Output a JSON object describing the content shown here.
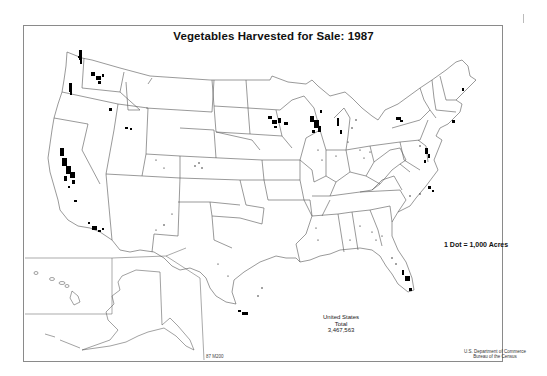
{
  "map": {
    "title": "Vegetables Harvested for Sale: 1987",
    "legend": "1 Dot = 1,000 Acres",
    "total": {
      "line1": "United States",
      "line2": "Total",
      "value": "3,467,563"
    },
    "credit": {
      "line1": "U.S. Department of Commerce",
      "line2": "Bureau of the Census"
    },
    "map_code": "87 M200",
    "type": "dot-density",
    "region": "United States (contiguous, with Alaska and Hawaii insets)",
    "colors": {
      "dots": "#000000",
      "borders": "#555555",
      "frame": "#8a8a8a",
      "background": "#ffffff"
    },
    "dense_clusters": [
      "California Central Valley",
      "Southern California coast",
      "Puget Sound / Skagit (Washington)",
      "Willamette Valley (Oregon)",
      "Columbia Basin (Washington)",
      "Southern Minnesota",
      "Wisconsin central sands",
      "Western Michigan",
      "Lower Rio Grande Valley (Texas)",
      "South Florida",
      "Delmarva / New Jersey",
      "Western New York",
      "Eastern North Carolina",
      "Aroostook (Maine)"
    ]
  }
}
